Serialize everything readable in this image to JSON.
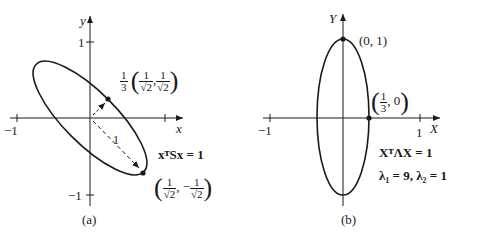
{
  "panel_a": {
    "caption": "(a)",
    "x_axis_label": "x",
    "y_axis_label": "y",
    "tick_x_neg": "−1",
    "tick_y_pos": "1",
    "tick_y_neg": "−1",
    "equation": "xᵀSx = 1",
    "distance_label": "1",
    "point_short": {
      "prefix_num": "1",
      "prefix_den": "3",
      "x_num": "1",
      "x_den": "√2",
      "y_num": "1",
      "y_den": "√2",
      "y_sign": ""
    },
    "point_long": {
      "x_num": "1",
      "x_den": "√2",
      "y_num": "1",
      "y_den": "√2",
      "y_sign": "−"
    }
  },
  "panel_b": {
    "caption": "(b)",
    "x_axis_label": "X",
    "y_axis_label": "Y",
    "tick_x_neg": "−1",
    "tick_x_pos": "1",
    "point_top": "(0, 1)",
    "point_right": {
      "x_num": "1",
      "x_den": "3",
      "y": "0"
    },
    "equation": "XᵀΛX = 1",
    "eigenvalues": "λ₁ = 9,   λ₂ = 1"
  }
}
